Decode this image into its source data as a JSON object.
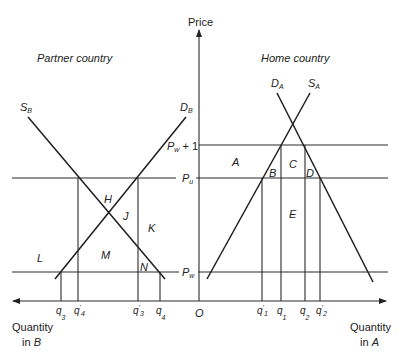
{
  "axes": {
    "price_label": "Price",
    "origin_label": "O",
    "quantity_b_line1": "Quantity",
    "quantity_b_line2": "in",
    "quantity_b_var": "B",
    "quantity_a_line1": "Quantity",
    "quantity_a_line2": "in",
    "quantity_a_var": "A"
  },
  "price_levels": {
    "pw_plus_1": {
      "base": "P",
      "sub": "w",
      "suffix": " + 1"
    },
    "pu": {
      "base": "P",
      "sub": "u"
    },
    "pw": {
      "base": "P",
      "sub": "w"
    }
  },
  "partner": {
    "title": "Partner country",
    "supply": {
      "base": "S",
      "sub": "B"
    },
    "demand": {
      "base": "D",
      "sub": "B"
    },
    "areas": [
      "H",
      "J",
      "K",
      "L",
      "M",
      "N"
    ],
    "quantities": [
      {
        "base": "q",
        "sub": "3",
        "prime": ""
      },
      {
        "base": "q",
        "sub": "4",
        "prime": "'"
      },
      {
        "base": "q",
        "sub": "3",
        "prime": "'"
      },
      {
        "base": "q",
        "sub": "4",
        "prime": ""
      }
    ]
  },
  "home": {
    "title": "Home country",
    "supply": {
      "base": "S",
      "sub": "A"
    },
    "demand": {
      "base": "D",
      "sub": "A"
    },
    "areas": [
      "A",
      "B",
      "C",
      "D",
      "E"
    ],
    "quantities": [
      {
        "base": "q",
        "sub": "1",
        "prime": "'"
      },
      {
        "base": "q",
        "sub": "1",
        "prime": ""
      },
      {
        "base": "q",
        "sub": "2",
        "prime": ""
      },
      {
        "base": "q",
        "sub": "2",
        "prime": "'"
      }
    ]
  }
}
